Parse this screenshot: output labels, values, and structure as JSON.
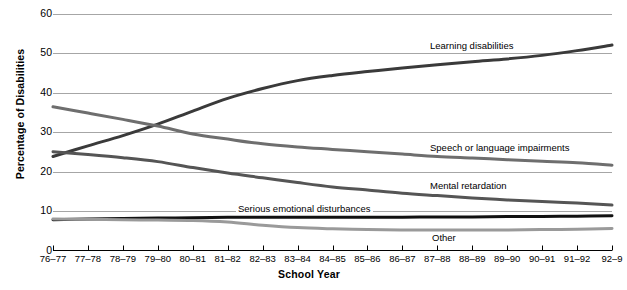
{
  "chart_data": {
    "type": "line",
    "title": "",
    "xlabel": "School Year",
    "ylabel": "Percentage of Disabilities",
    "ylim": [
      0,
      60
    ],
    "yticks": [
      0,
      10,
      20,
      30,
      40,
      50,
      60
    ],
    "grid": true,
    "legend_position": "inline-right",
    "categories": [
      "76–77",
      "77–78",
      "78–79",
      "79–80",
      "80–81",
      "81–82",
      "82–83",
      "83–84",
      "84–85",
      "85–86",
      "86–87",
      "87–88",
      "88–89",
      "89–90",
      "90–91",
      "91–92",
      "92–9"
    ],
    "last_tick_truncated": true,
    "series": [
      {
        "name": "Learning disabilities",
        "color": "#3a3a3a",
        "values": [
          23.8,
          26.5,
          29.1,
          32.0,
          35.3,
          38.5,
          41.0,
          43.0,
          44.3,
          45.3,
          46.2,
          47.0,
          47.8,
          48.5,
          49.4,
          50.6,
          52.0
        ]
      },
      {
        "name": "Speech or language impairments",
        "color": "#6e6e6e",
        "values": [
          36.4,
          34.8,
          33.2,
          31.5,
          29.5,
          28.2,
          27.0,
          26.2,
          25.6,
          25.0,
          24.4,
          23.8,
          23.4,
          23.0,
          22.6,
          22.2,
          21.6
        ]
      },
      {
        "name": "Mental retardation",
        "color": "#555555",
        "values": [
          25.0,
          24.3,
          23.5,
          22.5,
          21.0,
          19.6,
          18.4,
          17.2,
          16.1,
          15.3,
          14.5,
          13.9,
          13.3,
          12.8,
          12.4,
          12.0,
          11.5
        ]
      },
      {
        "name": "Serious emotional disturbances",
        "color": "#111111",
        "values": [
          7.8,
          8.0,
          8.1,
          8.2,
          8.3,
          8.4,
          8.4,
          8.4,
          8.4,
          8.4,
          8.4,
          8.5,
          8.5,
          8.6,
          8.6,
          8.7,
          8.8
        ]
      },
      {
        "name": "Other",
        "color": "#9a9a9a",
        "values": [
          8.0,
          7.9,
          7.8,
          7.7,
          7.6,
          7.2,
          6.4,
          5.8,
          5.5,
          5.3,
          5.2,
          5.2,
          5.2,
          5.2,
          5.3,
          5.4,
          5.6
        ]
      }
    ],
    "series_label_positions": [
      {
        "label": "Learning disabilities",
        "x": 428,
        "y": 40
      },
      {
        "label": "Speech or language impairments",
        "x": 428,
        "y": 142
      },
      {
        "label": "Mental retardation",
        "x": 428,
        "y": 180
      },
      {
        "label": "Serious emotional disturbances",
        "x": 236,
        "y": 203
      },
      {
        "label": "Other",
        "x": 430,
        "y": 232
      }
    ]
  }
}
